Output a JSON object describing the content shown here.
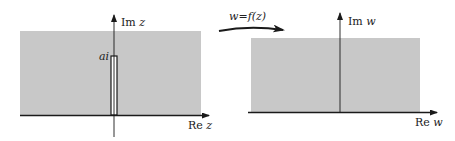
{
  "figure": {
    "colors": {
      "region_fill": "#c8c8c8",
      "axis": "#1a1a1a",
      "background": "#ffffff"
    },
    "z_plane": {
      "imag_axis_label_prefix": "Im",
      "imag_axis_label_var": "z",
      "real_axis_label_prefix": "Re",
      "real_axis_label_var": "z",
      "slit_label": "ai"
    },
    "mapping": {
      "label": "w=f(z)"
    },
    "w_plane": {
      "imag_axis_label_prefix": "Im",
      "imag_axis_label_var": "w",
      "real_axis_label_prefix": "Re",
      "real_axis_label_var": "w"
    }
  }
}
